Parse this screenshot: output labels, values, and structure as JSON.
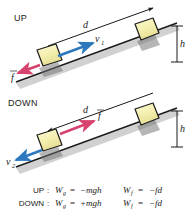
{
  "figure": {
    "colors": {
      "velocity_arrow": "#2e79bd",
      "friction_arrow": "#d6436e",
      "block_fill": "#f4efb0",
      "block_stroke": "#1a1a1a",
      "incline_line": "#1a1a1a",
      "incline_shadow": "#c9c9c9",
      "text": "#1a1a1a",
      "background": "#ffffff"
    },
    "panels": [
      {
        "id": "up",
        "case_label": "UP",
        "displacement_label": "d",
        "displacement_direction": "up-slope",
        "height_label": "h",
        "vectors": [
          {
            "name": "velocity",
            "label": "v",
            "subscript": "1",
            "color": "#2e79bd",
            "direction": "up-slope"
          },
          {
            "name": "friction",
            "label": "f",
            "subscript": "",
            "color": "#d6436e",
            "direction": "down-slope"
          }
        ]
      },
      {
        "id": "down",
        "case_label": "DOWN",
        "displacement_label": "d",
        "displacement_direction": "down-slope",
        "height_label": "h",
        "vectors": [
          {
            "name": "velocity",
            "label": "v",
            "subscript": "2",
            "color": "#2e79bd",
            "direction": "down-slope"
          },
          {
            "name": "friction",
            "label": "f",
            "subscript": "",
            "color": "#d6436e",
            "direction": "up-slope"
          }
        ]
      }
    ],
    "equations": [
      {
        "case": "UP",
        "separator": ":",
        "gravity_symbol": "W",
        "gravity_subscript": "g",
        "gravity_equals": "=",
        "gravity_value": "−mgh",
        "friction_symbol": "W",
        "friction_subscript": "f",
        "friction_equals": "=",
        "friction_value": "−fd"
      },
      {
        "case": "DOWN",
        "separator": ":",
        "gravity_symbol": "W",
        "gravity_subscript": "g",
        "gravity_equals": "=",
        "gravity_value": "+mgh",
        "friction_symbol": "W",
        "friction_subscript": "f",
        "friction_equals": "=",
        "friction_value": "−fd"
      }
    ]
  }
}
